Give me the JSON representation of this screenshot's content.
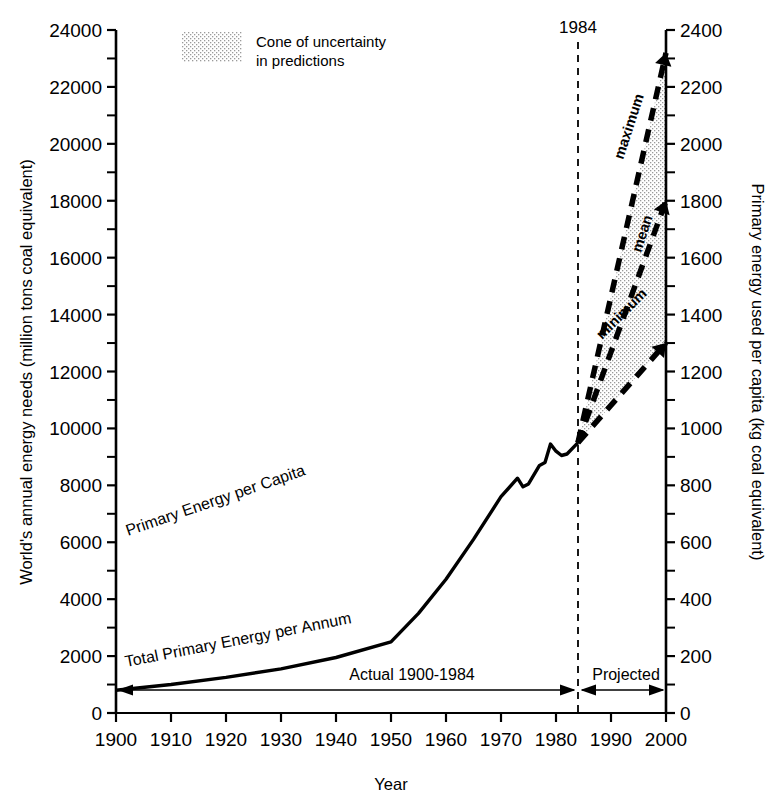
{
  "chart_data": {
    "type": "line",
    "title": "",
    "xlabel": "Year",
    "ylabel": "World's annual energy needs (million tons coal equivalent)",
    "y2label": "Primary energy used per capita (kg coal equivalent)",
    "xlim": [
      1900,
      2000
    ],
    "ylim": [
      0,
      24000
    ],
    "y2lim": [
      0,
      2400
    ],
    "xticks": [
      1900,
      1910,
      1920,
      1930,
      1940,
      1950,
      1960,
      1970,
      1980,
      1990,
      2000
    ],
    "xtick_labels": [
      "1900",
      "1910",
      "1920",
      "1930",
      "1940",
      "1950",
      "1960",
      "1970",
      "1980",
      "1990",
      "2000"
    ],
    "yticks": [
      0,
      2000,
      4000,
      6000,
      8000,
      10000,
      12000,
      14000,
      16000,
      18000,
      20000,
      22000,
      24000
    ],
    "ytick_labels": [
      "0",
      "2000",
      "4000",
      "6000",
      "8000",
      "10000",
      "12000",
      "14000",
      "16000",
      "18000",
      "20000",
      "22000",
      "24000"
    ],
    "y_minor_step": 1000,
    "y2ticks": [
      0,
      200,
      400,
      600,
      800,
      1000,
      1200,
      1400,
      1600,
      1800,
      2000,
      2200,
      2400
    ],
    "y2tick_labels": [
      "0",
      "200",
      "400",
      "600",
      "800",
      "1000",
      "1200",
      "1400",
      "1600",
      "1800",
      "2000",
      "2200",
      "2400"
    ],
    "y2_minor_step": 100,
    "grid": false,
    "legend_position": "top-left",
    "legend": [
      {
        "label_line1": "Cone of uncertainty",
        "label_line2": "in predictions",
        "swatch": "stippled"
      }
    ],
    "series": [
      {
        "name": "Primary Energy per Capita",
        "axis": "right",
        "style": "solid",
        "label": "Primary Energy per Capita",
        "label_rotation": -20,
        "points": [
          [
            1900,
            4800
          ],
          [
            1910,
            5700
          ],
          [
            1920,
            6600
          ],
          [
            1925,
            7350
          ],
          [
            1930,
            7750
          ],
          [
            1935,
            8050
          ],
          [
            1940,
            8350
          ],
          [
            1945,
            8700
          ],
          [
            1950,
            9500
          ],
          [
            1955,
            11100
          ],
          [
            1960,
            12700
          ],
          [
            1965,
            14700
          ],
          [
            1970,
            17200
          ],
          [
            1973,
            19850
          ],
          [
            1975,
            18100
          ],
          [
            1977,
            19000
          ],
          [
            1978,
            19100
          ],
          [
            1979,
            20150
          ],
          [
            1980,
            19400
          ],
          [
            1982,
            18500
          ],
          [
            1983,
            18250
          ],
          [
            1984,
            18350
          ]
        ]
      },
      {
        "name": "Total Primary Energy per Annum",
        "axis": "left",
        "style": "solid",
        "label": "Total Primary Energy per Annum",
        "label_rotation": -12,
        "points": [
          [
            1900,
            800
          ],
          [
            1910,
            1000
          ],
          [
            1920,
            1250
          ],
          [
            1930,
            1550
          ],
          [
            1940,
            1950
          ],
          [
            1950,
            2500
          ],
          [
            1955,
            3500
          ],
          [
            1960,
            4700
          ],
          [
            1965,
            6100
          ],
          [
            1970,
            7600
          ],
          [
            1973,
            8250
          ],
          [
            1974,
            7950
          ],
          [
            1975,
            8050
          ],
          [
            1977,
            8700
          ],
          [
            1978,
            8800
          ],
          [
            1979,
            9450
          ],
          [
            1980,
            9200
          ],
          [
            1981,
            9050
          ],
          [
            1982,
            9100
          ],
          [
            1984,
            9500
          ]
        ]
      },
      {
        "name": "maximum",
        "axis": "left",
        "style": "dashed",
        "label": "maximum",
        "points": [
          [
            1984,
            9500
          ],
          [
            2000,
            23200
          ]
        ]
      },
      {
        "name": "mean",
        "axis": "left",
        "style": "dashed",
        "label": "mean",
        "points": [
          [
            1984,
            9500
          ],
          [
            2000,
            18000
          ]
        ]
      },
      {
        "name": "minimum",
        "axis": "left",
        "style": "dashed",
        "label": "minimum",
        "points": [
          [
            1984,
            9500
          ],
          [
            2000,
            13000
          ]
        ]
      }
    ],
    "shaded_region": {
      "name": "cone-of-uncertainty",
      "fill": "stipple",
      "upper": [
        [
          1984,
          9500
        ],
        [
          2000,
          23200
        ]
      ],
      "lower": [
        [
          1984,
          9500
        ],
        [
          2000,
          13000
        ]
      ]
    },
    "annotations": [
      {
        "name": "marker-1984",
        "text": "1984",
        "x": 1984,
        "type": "vertical-dashed-line"
      },
      {
        "name": "range-actual",
        "text": "Actual 1900-1984",
        "from": 1900,
        "to": 1984,
        "type": "double-arrow"
      },
      {
        "name": "range-projected",
        "text": "Projected",
        "from": 1984,
        "to": 2000,
        "type": "double-arrow"
      }
    ],
    "colors": {
      "line": "#000000",
      "axis": "#000000",
      "stipple": "#bdbdbd",
      "background": "#ffffff"
    }
  }
}
